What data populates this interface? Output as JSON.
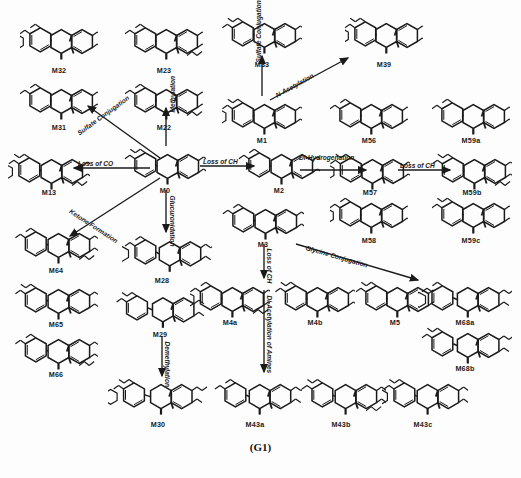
{
  "figure": {
    "caption": "(G1)",
    "type": "metabolic-pathway-diagram",
    "background_color": "#fdfdfd",
    "stroke_color": "#1a1a1a"
  },
  "nodes": [
    {
      "id": "M32",
      "label": "M32",
      "x": 20,
      "y": 18,
      "w": 78,
      "h": 42,
      "label_x": 59,
      "label_y": 66,
      "variant": 0
    },
    {
      "id": "M23",
      "label": "M23",
      "x": 125,
      "y": 18,
      "w": 78,
      "h": 42,
      "label_x": 164,
      "label_y": 66,
      "variant": 1
    },
    {
      "id": "M33",
      "label": "M33",
      "x": 222,
      "y": 12,
      "w": 80,
      "h": 42,
      "label_x": 262,
      "label_y": 60,
      "variant": 2
    },
    {
      "id": "M39",
      "label": "M39",
      "x": 345,
      "y": 12,
      "w": 78,
      "h": 42,
      "label_x": 384,
      "label_y": 60,
      "variant": 3
    },
    {
      "id": "M31",
      "label": "M31",
      "x": 20,
      "y": 78,
      "w": 78,
      "h": 42,
      "label_x": 59,
      "label_y": 123,
      "variant": 4
    },
    {
      "id": "M22",
      "label": "M22",
      "x": 125,
      "y": 78,
      "w": 78,
      "h": 42,
      "label_x": 164,
      "label_y": 123,
      "variant": 5
    },
    {
      "id": "M1",
      "label": "M1",
      "x": 222,
      "y": 93,
      "w": 80,
      "h": 42,
      "label_x": 262,
      "label_y": 136,
      "variant": 6
    },
    {
      "id": "M56",
      "label": "M56",
      "x": 330,
      "y": 93,
      "w": 78,
      "h": 42,
      "label_x": 369,
      "label_y": 136,
      "variant": 7
    },
    {
      "id": "M59a",
      "label": "M59a",
      "x": 432,
      "y": 93,
      "w": 78,
      "h": 42,
      "label_x": 471,
      "label_y": 136,
      "variant": 8
    },
    {
      "id": "M13",
      "label": "M13",
      "x": 8,
      "y": 148,
      "w": 82,
      "h": 42,
      "label_x": 49,
      "label_y": 188,
      "variant": 9
    },
    {
      "id": "M0",
      "label": "M0",
      "x": 124,
      "y": 143,
      "w": 82,
      "h": 42,
      "label_x": 165,
      "label_y": 186,
      "variant": 10
    },
    {
      "id": "M2",
      "label": "M2",
      "x": 238,
      "y": 143,
      "w": 82,
      "h": 42,
      "label_x": 279,
      "label_y": 186,
      "variant": 11
    },
    {
      "id": "M57",
      "label": "M57",
      "x": 330,
      "y": 148,
      "w": 80,
      "h": 42,
      "label_x": 370,
      "label_y": 188,
      "variant": 12
    },
    {
      "id": "M59b",
      "label": "M59b",
      "x": 432,
      "y": 148,
      "w": 80,
      "h": 42,
      "label_x": 472,
      "label_y": 188,
      "variant": 13
    },
    {
      "id": "M3",
      "label": "M3",
      "x": 222,
      "y": 198,
      "w": 82,
      "h": 42,
      "label_x": 263,
      "label_y": 240,
      "variant": 14
    },
    {
      "id": "M58",
      "label": "M58",
      "x": 330,
      "y": 192,
      "w": 78,
      "h": 42,
      "label_x": 369,
      "label_y": 236,
      "variant": 15
    },
    {
      "id": "M59c",
      "label": "M59c",
      "x": 432,
      "y": 192,
      "w": 78,
      "h": 42,
      "label_x": 471,
      "label_y": 236,
      "variant": 16
    },
    {
      "id": "M64",
      "label": "M64",
      "x": 14,
      "y": 222,
      "w": 84,
      "h": 42,
      "label_x": 56,
      "label_y": 266,
      "variant": 17
    },
    {
      "id": "M28",
      "label": "M28",
      "x": 122,
      "y": 228,
      "w": 90,
      "h": 46,
      "label_x": 162,
      "label_y": 276,
      "variant": 18
    },
    {
      "id": "M65",
      "label": "M65",
      "x": 14,
      "y": 278,
      "w": 84,
      "h": 42,
      "label_x": 56,
      "label_y": 320,
      "variant": 19
    },
    {
      "id": "M29",
      "label": "M29",
      "x": 112,
      "y": 284,
      "w": 96,
      "h": 46,
      "label_x": 160,
      "label_y": 330,
      "variant": 20
    },
    {
      "id": "M4a",
      "label": "M4a",
      "x": 190,
      "y": 276,
      "w": 80,
      "h": 42,
      "label_x": 230,
      "label_y": 318,
      "variant": 21
    },
    {
      "id": "M4b",
      "label": "M4b",
      "x": 275,
      "y": 276,
      "w": 80,
      "h": 42,
      "label_x": 315,
      "label_y": 318,
      "variant": 22
    },
    {
      "id": "M5",
      "label": "M5",
      "x": 356,
      "y": 276,
      "w": 78,
      "h": 42,
      "label_x": 395,
      "label_y": 318,
      "variant": 23
    },
    {
      "id": "M68a",
      "label": "M68a",
      "x": 418,
      "y": 276,
      "w": 94,
      "h": 42,
      "label_x": 465,
      "label_y": 318,
      "variant": 24
    },
    {
      "id": "M66",
      "label": "M66",
      "x": 14,
      "y": 328,
      "w": 84,
      "h": 42,
      "label_x": 56,
      "label_y": 370,
      "variant": 25
    },
    {
      "id": "M68b",
      "label": "M68b",
      "x": 418,
      "y": 322,
      "w": 94,
      "h": 42,
      "label_x": 465,
      "label_y": 364,
      "variant": 26
    },
    {
      "id": "M30",
      "label": "M30",
      "x": 108,
      "y": 372,
      "w": 100,
      "h": 44,
      "label_x": 158,
      "label_y": 420,
      "variant": 27
    },
    {
      "id": "M43a",
      "label": "M43a",
      "x": 212,
      "y": 372,
      "w": 90,
      "h": 44,
      "label_x": 255,
      "label_y": 420,
      "variant": 28
    },
    {
      "id": "M43b",
      "label": "M43b",
      "x": 300,
      "y": 372,
      "w": 86,
      "h": 44,
      "label_x": 341,
      "label_y": 420,
      "variant": 29
    },
    {
      "id": "M43c",
      "label": "M43c",
      "x": 382,
      "y": 372,
      "w": 86,
      "h": 44,
      "label_x": 423,
      "label_y": 420,
      "variant": 30
    }
  ],
  "edges": [
    {
      "id": "e-sulfate-conj-m31",
      "label": "Sulfate Conjugation",
      "x1": 160,
      "y1": 158,
      "x2": 88,
      "y2": 106,
      "label_x": 78,
      "label_y": 130,
      "rotate": -36
    },
    {
      "id": "e-loss-of-co",
      "label": "Loss of CO",
      "x1": 150,
      "y1": 168,
      "x2": 74,
      "y2": 168,
      "label_x": 78,
      "label_y": 160,
      "rotate": 0
    },
    {
      "id": "e-methylation",
      "label": "Methylation",
      "x1": 166,
      "y1": 146,
      "x2": 166,
      "y2": 108,
      "label_x": 172,
      "label_y": 109,
      "rotate": -90
    },
    {
      "id": "e-ketone-formation",
      "label": "Ketone Formation",
      "x1": 160,
      "y1": 178,
      "x2": 70,
      "y2": 236,
      "label_x": 70,
      "label_y": 207,
      "rotate": 33
    },
    {
      "id": "e-glucuronidation",
      "label": "Glucuronidation",
      "x1": 166,
      "y1": 190,
      "x2": 166,
      "y2": 232,
      "label_x": 172,
      "label_y": 192,
      "rotate": 90
    },
    {
      "id": "e-loss-of-ch-m0-m2",
      "label": "Loss of CH",
      "x1": 200,
      "y1": 166,
      "x2": 254,
      "y2": 166,
      "label_x": 203,
      "label_y": 158,
      "rotate": 0
    },
    {
      "id": "e-sulfate-conj-m33",
      "label": "Sulfate Conjugation",
      "x1": 262,
      "y1": 96,
      "x2": 262,
      "y2": 56,
      "label_x": 258,
      "label_y": 59,
      "rotate": -90
    },
    {
      "id": "e-n-acetylation",
      "label": "N-Acetylation",
      "x1": 270,
      "y1": 100,
      "x2": 348,
      "y2": 58,
      "label_x": 276,
      "label_y": 92,
      "rotate": -29
    },
    {
      "id": "e-di-hydrogenation",
      "label": "Di-Hydrogenation",
      "x1": 300,
      "y1": 170,
      "x2": 366,
      "y2": 170,
      "label_x": 299,
      "label_y": 154,
      "rotate": 0
    },
    {
      "id": "e-loss-of-ch-m57",
      "label": "Loss of CH",
      "x1": 398,
      "y1": 170,
      "x2": 450,
      "y2": 170,
      "label_x": 400,
      "label_y": 162,
      "rotate": 0
    },
    {
      "id": "e-loss-of-ch-m3",
      "label": "Loss of CH",
      "x1": 264,
      "y1": 244,
      "x2": 264,
      "y2": 278,
      "label_x": 269,
      "label_y": 245,
      "rotate": 90
    },
    {
      "id": "e-glycine-conjugation",
      "label": "Glycine Conjugation",
      "x1": 296,
      "y1": 244,
      "x2": 418,
      "y2": 280,
      "label_x": 306,
      "label_y": 244,
      "rotate": 16
    },
    {
      "id": "e-di-acetylation-amines",
      "label": "Di-Acetylation of Amines",
      "x1": 264,
      "y1": 290,
      "x2": 264,
      "y2": 372,
      "label_x": 269,
      "label_y": 292,
      "rotate": 90
    },
    {
      "id": "e-demethylation",
      "label": "Demethylation",
      "x1": 162,
      "y1": 336,
      "x2": 162,
      "y2": 376,
      "label_x": 167,
      "label_y": 338,
      "rotate": 90
    }
  ]
}
